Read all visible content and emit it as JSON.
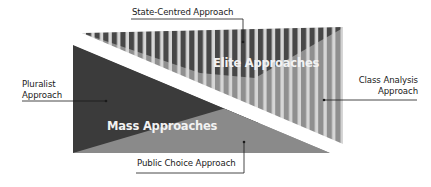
{
  "diagram": {
    "regions": {
      "elite": "Elite Approaches",
      "mass": "Mass Approaches"
    },
    "labels": {
      "state_centred": "State-Centred Approach",
      "pluralist_line1": "Pluralist",
      "pluralist_line2": "Approach",
      "class_analysis_line1": "Class Analysis",
      "class_analysis_line2": "Approach",
      "public_choice": "Public Choice Approach"
    },
    "colors": {
      "dark": "#3d3d3d",
      "mid": "#8c8c8c",
      "stripe_dark": "#4a4a4a",
      "stripe_mid": "#8e8e8e",
      "stripe_light": "#d4d4d4",
      "line": "#1a1a1a"
    }
  }
}
